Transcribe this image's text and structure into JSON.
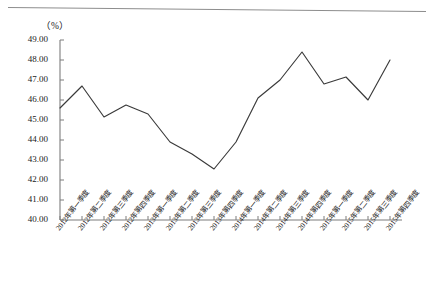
{
  "chart_data": {
    "type": "line",
    "title": "",
    "subtitle": "",
    "unit_label": "（%）",
    "xlabel": "",
    "ylabel": "",
    "ylim": [
      40.0,
      49.0
    ],
    "ytick_step": 1.0,
    "grid": false,
    "legend": null,
    "line_color": "#3a3a3a",
    "categories": [
      "2012年第一季度",
      "2012年第二季度",
      "2012年第三季度",
      "2012年第四季度",
      "2013年第一季度",
      "2013年第二季度",
      "2013年第三季度",
      "2013年第四季度",
      "2014年第一季度",
      "2014年第二季度",
      "2014年第三季度",
      "2014年第四季度",
      "2015年第一季度",
      "2015年第二季度",
      "2015年第三季度",
      "2015年第四季度"
    ],
    "values": [
      45.6,
      46.7,
      45.15,
      45.75,
      45.3,
      43.9,
      43.3,
      42.55,
      43.9,
      46.1,
      47.0,
      48.4,
      46.8,
      47.15,
      46.0,
      48.0
    ],
    "ytick_labels": [
      "49.00",
      "48.00",
      "47.00",
      "46.00",
      "45.00",
      "44.00",
      "43.00",
      "42.00",
      "41.00",
      "40.00"
    ],
    "ytick_values": [
      49.0,
      48.0,
      47.0,
      46.0,
      45.0,
      44.0,
      43.0,
      42.0,
      41.0,
      40.0
    ]
  }
}
